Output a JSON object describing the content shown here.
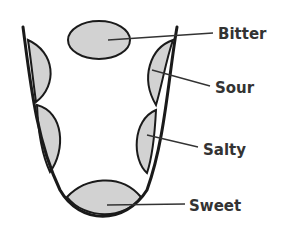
{
  "diagram": {
    "title": "",
    "colors": {
      "outline": "#1a1a1a",
      "region_fill": "#d2d2d2",
      "leader": "#333333",
      "label": "#333333"
    },
    "regions": [
      {
        "id": "bitter",
        "label": "Bitter"
      },
      {
        "id": "sour",
        "label": "Sour"
      },
      {
        "id": "salty",
        "label": "Salty"
      },
      {
        "id": "sweet",
        "label": "Sweet"
      }
    ]
  }
}
